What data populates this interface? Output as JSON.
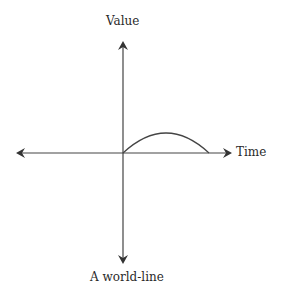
{
  "diagram": {
    "y_axis_label": "Value",
    "x_axis_label": "Time",
    "caption": "A world-line",
    "curve": "arc",
    "colors": {
      "line": "#444444",
      "text": "#2a2a2a",
      "background": "#ffffff"
    }
  }
}
